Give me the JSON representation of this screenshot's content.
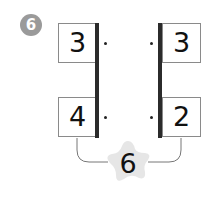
{
  "problem": {
    "number": "6",
    "badge_color": "#9a9a9a",
    "left_column": {
      "top": "3",
      "bottom": "4"
    },
    "right_column": {
      "top": "3",
      "bottom": "2"
    },
    "result_star": {
      "value": "6",
      "fill": "#e6e6e6"
    }
  }
}
